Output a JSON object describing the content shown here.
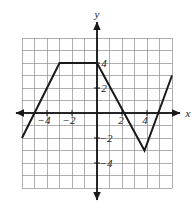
{
  "figure": {
    "title": "",
    "axis_labels": {
      "x": "x",
      "y": "y"
    },
    "x_tick_labels": [
      "−4",
      "−2",
      "2",
      "4"
    ],
    "x_tick_values": [
      -4,
      -2,
      2,
      4
    ],
    "y_tick_labels": [
      "4",
      "2",
      "−2",
      "−4"
    ],
    "y_tick_values": [
      4,
      2,
      -2,
      -4
    ],
    "colors": {
      "grid": "#8d8d8d",
      "axis": "#1a1a1a",
      "curve": "#1a1a1a",
      "background": "#ffffff"
    }
  },
  "chart_data": {
    "type": "line",
    "title": "",
    "xlabel": "x",
    "ylabel": "y",
    "xlim": [
      -6,
      6
    ],
    "ylim": [
      -6,
      6
    ],
    "grid": true,
    "grid_step": 1,
    "legend": "none",
    "series": [
      {
        "name": "piecewise-linear-function",
        "x": [
          -6,
          -3,
          0,
          3.8,
          6
        ],
        "y": [
          -2,
          4,
          4,
          -3,
          3
        ],
        "points": [
          {
            "x": -6,
            "y": -2
          },
          {
            "x": -3,
            "y": 4
          },
          {
            "x": 0,
            "y": 4
          },
          {
            "x": 3.8,
            "y": -3
          },
          {
            "x": 6,
            "y": 3
          }
        ]
      }
    ],
    "annotations": []
  }
}
